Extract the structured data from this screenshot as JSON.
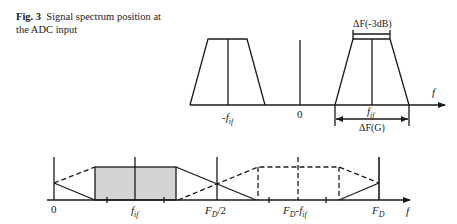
{
  "caption": {
    "label": "Fig. 3",
    "text": "Signal spectrum position at the ADC input"
  },
  "top_diagram": {
    "labels": {
      "neg_fif": "-f",
      "neg_fif_sub": "if",
      "zero": "0",
      "fif": "f",
      "fif_sub": "if",
      "axis_f": "f",
      "bw_3db": "ΔF(-3dB)",
      "bw_g": "ΔF(G)"
    }
  },
  "bottom_diagram": {
    "labels": {
      "zero": "0",
      "fif": "f",
      "fif_sub": "if",
      "fd_half": "F",
      "fd_half_sub": "D",
      "fd_half_suffix": "/2",
      "fd_minus_fif": "F",
      "fd_minus_fif_sub": "D",
      "fd_minus_fif_suffix": "-f",
      "fd_minus_fif_sub2": "if",
      "fd": "F",
      "fd_sub": "D",
      "axis_f": "f"
    }
  },
  "colors": {
    "stroke": "#1a1a1a",
    "shade": "#d4d4d4"
  }
}
